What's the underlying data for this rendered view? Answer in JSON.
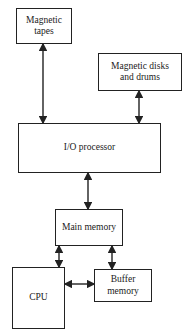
{
  "diagram": {
    "title": "",
    "nodes": [
      {
        "id": "tapes",
        "label": "Magnetic tapes",
        "lines": [
          "Magnetic",
          "tapes"
        ]
      },
      {
        "id": "disks",
        "label": "Magnetic disks and drums",
        "lines": [
          "Magnetic disks",
          "and drums"
        ]
      },
      {
        "id": "iop",
        "label": "I/O processor",
        "lines": [
          "I/O processor"
        ]
      },
      {
        "id": "main",
        "label": "Main memory",
        "lines": [
          "Main memory"
        ]
      },
      {
        "id": "cpu",
        "label": "CPU",
        "lines": [
          "CPU"
        ]
      },
      {
        "id": "buffer",
        "label": "Buffer memory",
        "lines": [
          "Buffer",
          "memory"
        ]
      }
    ],
    "edges": [
      {
        "from": "tapes",
        "to": "iop",
        "direction": "bidirectional"
      },
      {
        "from": "disks",
        "to": "iop",
        "direction": "bidirectional"
      },
      {
        "from": "iop",
        "to": "main",
        "direction": "bidirectional"
      },
      {
        "from": "main",
        "to": "cpu",
        "direction": "bidirectional"
      },
      {
        "from": "main",
        "to": "buffer",
        "direction": "bidirectional"
      },
      {
        "from": "cpu",
        "to": "buffer",
        "direction": "bidirectional"
      }
    ]
  }
}
